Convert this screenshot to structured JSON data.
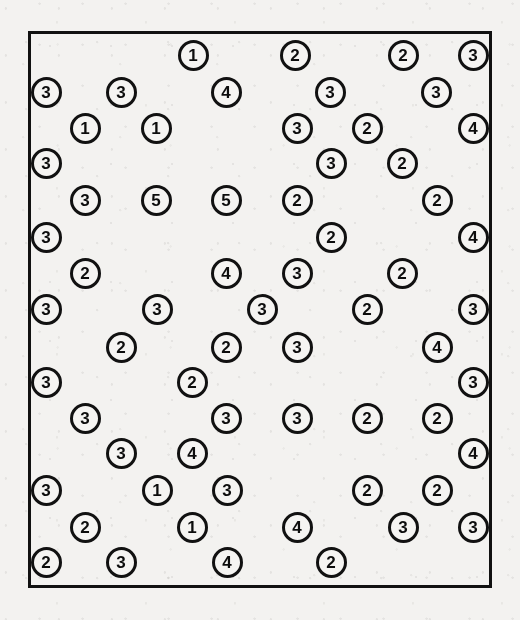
{
  "figure": {
    "kind": "numbered-circle-scatter",
    "background_color": "#f3f2f0",
    "ink_color": "#111111",
    "token_fill_color": "#f5f4f2",
    "frame": {
      "x": 28,
      "y": 31,
      "width": 464,
      "height": 557,
      "border_width": 3
    },
    "token": {
      "diameter": 31,
      "border_width": 3,
      "font_size": 17
    }
  },
  "chart_data": {
    "type": "scatter",
    "title": "",
    "xlabel": "",
    "ylabel": "",
    "grid": false,
    "legend": "none",
    "point_label_key": "value",
    "value_counts": {
      "1": 8,
      "2": 25,
      "3": 33,
      "4": 11,
      "5": 2
    },
    "total_points": 79,
    "distinct_values": [
      1,
      2,
      3,
      4,
      5
    ],
    "points": [
      {
        "value": "1",
        "x": 193,
        "y": 55
      },
      {
        "value": "2",
        "x": 295,
        "y": 55
      },
      {
        "value": "2",
        "x": 403,
        "y": 55
      },
      {
        "value": "3",
        "x": 473,
        "y": 55
      },
      {
        "value": "3",
        "x": 46,
        "y": 92
      },
      {
        "value": "3",
        "x": 121,
        "y": 92
      },
      {
        "value": "4",
        "x": 226,
        "y": 92
      },
      {
        "value": "3",
        "x": 330,
        "y": 92
      },
      {
        "value": "3",
        "x": 436,
        "y": 92
      },
      {
        "value": "1",
        "x": 85,
        "y": 128
      },
      {
        "value": "1",
        "x": 156,
        "y": 128
      },
      {
        "value": "3",
        "x": 297,
        "y": 128
      },
      {
        "value": "2",
        "x": 367,
        "y": 128
      },
      {
        "value": "4",
        "x": 473,
        "y": 128
      },
      {
        "value": "3",
        "x": 46,
        "y": 163
      },
      {
        "value": "3",
        "x": 331,
        "y": 163
      },
      {
        "value": "2",
        "x": 402,
        "y": 163
      },
      {
        "value": "3",
        "x": 85,
        "y": 200
      },
      {
        "value": "5",
        "x": 156,
        "y": 200
      },
      {
        "value": "5",
        "x": 226,
        "y": 200
      },
      {
        "value": "2",
        "x": 297,
        "y": 200
      },
      {
        "value": "2",
        "x": 437,
        "y": 200
      },
      {
        "value": "3",
        "x": 46,
        "y": 237
      },
      {
        "value": "2",
        "x": 331,
        "y": 237
      },
      {
        "value": "4",
        "x": 473,
        "y": 237
      },
      {
        "value": "2",
        "x": 85,
        "y": 273
      },
      {
        "value": "4",
        "x": 226,
        "y": 273
      },
      {
        "value": "3",
        "x": 297,
        "y": 273
      },
      {
        "value": "2",
        "x": 402,
        "y": 273
      },
      {
        "value": "3",
        "x": 46,
        "y": 309
      },
      {
        "value": "3",
        "x": 157,
        "y": 309
      },
      {
        "value": "3",
        "x": 262,
        "y": 309
      },
      {
        "value": "2",
        "x": 367,
        "y": 309
      },
      {
        "value": "3",
        "x": 473,
        "y": 309
      },
      {
        "value": "2",
        "x": 121,
        "y": 347
      },
      {
        "value": "2",
        "x": 226,
        "y": 347
      },
      {
        "value": "3",
        "x": 297,
        "y": 347
      },
      {
        "value": "4",
        "x": 437,
        "y": 347
      },
      {
        "value": "3",
        "x": 46,
        "y": 382
      },
      {
        "value": "2",
        "x": 192,
        "y": 382
      },
      {
        "value": "3",
        "x": 473,
        "y": 382
      },
      {
        "value": "3",
        "x": 85,
        "y": 418
      },
      {
        "value": "3",
        "x": 226,
        "y": 418
      },
      {
        "value": "3",
        "x": 297,
        "y": 418
      },
      {
        "value": "2",
        "x": 367,
        "y": 418
      },
      {
        "value": "2",
        "x": 437,
        "y": 418
      },
      {
        "value": "3",
        "x": 121,
        "y": 453
      },
      {
        "value": "4",
        "x": 192,
        "y": 453
      },
      {
        "value": "4",
        "x": 473,
        "y": 453
      },
      {
        "value": "3",
        "x": 46,
        "y": 490
      },
      {
        "value": "1",
        "x": 157,
        "y": 490
      },
      {
        "value": "3",
        "x": 227,
        "y": 490
      },
      {
        "value": "2",
        "x": 367,
        "y": 490
      },
      {
        "value": "2",
        "x": 437,
        "y": 490
      },
      {
        "value": "2",
        "x": 85,
        "y": 527
      },
      {
        "value": "1",
        "x": 192,
        "y": 527
      },
      {
        "value": "4",
        "x": 297,
        "y": 527
      },
      {
        "value": "3",
        "x": 403,
        "y": 527
      },
      {
        "value": "3",
        "x": 473,
        "y": 527
      },
      {
        "value": "2",
        "x": 46,
        "y": 562
      },
      {
        "value": "3",
        "x": 121,
        "y": 562
      },
      {
        "value": "4",
        "x": 227,
        "y": 562
      },
      {
        "value": "2",
        "x": 331,
        "y": 562
      }
    ]
  }
}
